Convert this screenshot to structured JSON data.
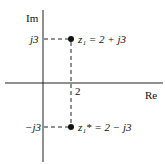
{
  "axes": {
    "imag_label": "Im",
    "real_label": "Re",
    "x_tick": "2",
    "y_tick_pos": "j3",
    "y_tick_neg": "−j3"
  },
  "points": [
    {
      "name": "z1",
      "label": "z₁ = 2 + j3",
      "re": 2,
      "im": 3
    },
    {
      "name": "z1_conj",
      "label": "z₁* = 2 − j3",
      "re": 2,
      "im": -3
    }
  ]
}
